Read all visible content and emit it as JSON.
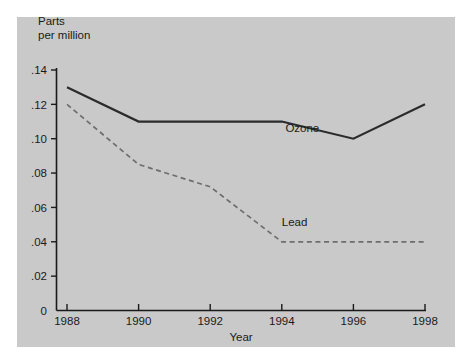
{
  "chart_data": {
    "type": "line",
    "title": "",
    "subtitle": "",
    "ylabel": "Parts\nper million",
    "xlabel": "Year",
    "x": [
      1988,
      1990,
      1992,
      1994,
      1996,
      1998
    ],
    "xtick_labels": [
      "1988",
      "1990",
      "1992",
      "1994",
      "1996",
      "1998"
    ],
    "ytick_labels": [
      "0",
      ".02",
      ".04",
      ".06",
      ".08",
      ".10",
      ".12",
      ".14"
    ],
    "ytick_values": [
      0,
      0.02,
      0.04,
      0.06,
      0.08,
      0.1,
      0.12,
      0.14
    ],
    "ylim": [
      0,
      0.14
    ],
    "xlim": [
      1988,
      1998
    ],
    "grid": false,
    "legend_position": "inline-labels",
    "series": [
      {
        "name": "Ozone",
        "label": "Ozone",
        "style": "solid",
        "color": "#2b2b2b",
        "x": [
          1988,
          1990,
          1994,
          1996,
          1998
        ],
        "values": [
          0.13,
          0.11,
          0.11,
          0.1,
          0.12
        ]
      },
      {
        "name": "Lead",
        "label": "Lead",
        "style": "dashed",
        "color": "#6d6d6d",
        "x": [
          1988,
          1990,
          1992,
          1994,
          1996,
          1998
        ],
        "values": [
          0.12,
          0.085,
          0.072,
          0.04,
          0.04,
          0.04
        ]
      }
    ],
    "annotations": [
      {
        "text": "Ozone",
        "x": 1994.1,
        "y": 0.104
      },
      {
        "text": "Lead",
        "x": 1994.0,
        "y": 0.049
      }
    ]
  },
  "colors": {
    "page_background": "#ffffff",
    "panel_background": "#c9c9c9",
    "axis": "#1a1a1a",
    "ozone_line": "#2b2b2b",
    "lead_line": "#6d6d6d",
    "text": "#1a1a1a"
  }
}
